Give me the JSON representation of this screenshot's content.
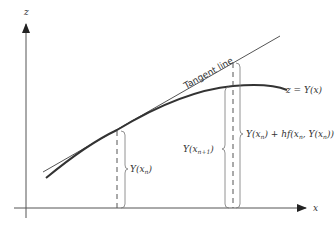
{
  "diagram": {
    "axes": {
      "vertical_label": "z",
      "horizontal_label": "x"
    },
    "curve_label": "z = Y(x)",
    "tangent_label": "Tangent line",
    "labels": {
      "y_xn_main": "Y(x",
      "y_xn_sub": "n",
      "y_xn_close": ")",
      "y_xn1_main": "Y(x",
      "y_xn1_sub": "n+1",
      "y_xn1_close": ")",
      "euler_a": "Y(x",
      "euler_a_sub": "n",
      "euler_b": ") + hf(x",
      "euler_b_sub": "n",
      "euler_c": ", Y(x",
      "euler_c_sub": "n",
      "euler_d": "))"
    },
    "colors": {
      "axis": "#555555",
      "curve": "#333333",
      "tangent": "#555555",
      "brace": "#777777"
    }
  }
}
